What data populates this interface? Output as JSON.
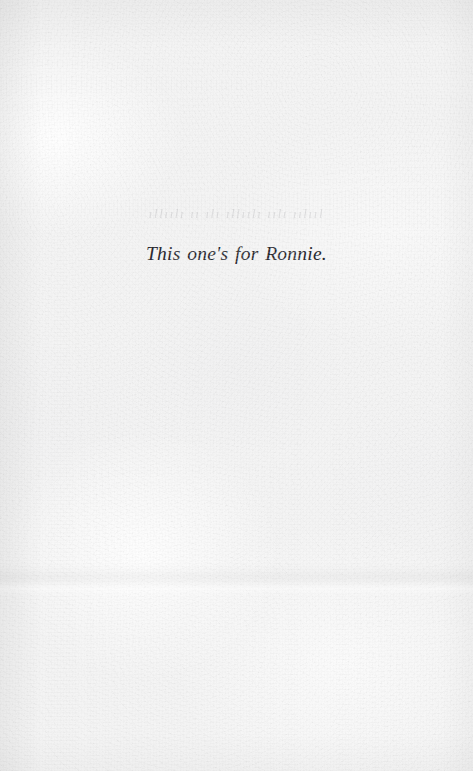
{
  "page": {
    "type": "book-dedication-page",
    "width": 473,
    "height": 771,
    "paper_color": "#f4f4f4",
    "ink_color": "#2a2a30"
  },
  "dedication": {
    "text": "This one's for Ronnie."
  },
  "artifacts": {
    "ghost_text": {
      "description": "faint illegible show-through text from the reverse side of the leaf",
      "placeholder_glyphs": "ıllıılı ıı ılı ıllıılı ıılı ıılııl"
    },
    "crease": {
      "description": "horizontal fold shadow band across the lower third of the page"
    }
  }
}
